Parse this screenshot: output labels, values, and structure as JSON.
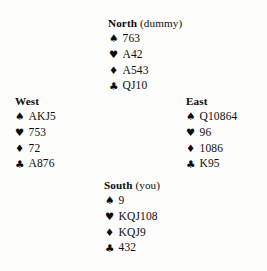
{
  "diagram": {
    "kind": "bridge-hand-diagram",
    "background_color": "#fdfdfc",
    "text_color": "#0d0d0d"
  },
  "suit_symbols": {
    "spade": "♠",
    "heart": "♥",
    "diamond": "♦",
    "club": "♣"
  },
  "hands": {
    "north": {
      "seat": "North",
      "qualifier": "(dummy)",
      "spades": "763",
      "hearts": "A42",
      "diamonds": "A543",
      "clubs": "QJ10"
    },
    "west": {
      "seat": "West",
      "qualifier": "",
      "spades": "AKJ5",
      "hearts": "753",
      "diamonds": "72",
      "clubs": "A876"
    },
    "east": {
      "seat": "East",
      "qualifier": "",
      "spades": "Q10864",
      "hearts": "96",
      "diamonds": "1086",
      "clubs": "K95"
    },
    "south": {
      "seat": "South",
      "qualifier": "(you)",
      "spades": "9",
      "hearts": "KQJ108",
      "diamonds": "KQJ9",
      "clubs": "432"
    }
  }
}
